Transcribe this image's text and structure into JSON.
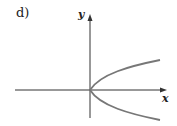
{
  "figure": {
    "label": "d)",
    "x_axis_label": "x",
    "y_axis_label": "y",
    "curve": "sideways parabola opening to the right, vertex at origin",
    "colors": {
      "axes": "#333333",
      "curve": "#777777",
      "text": "#222222"
    }
  }
}
